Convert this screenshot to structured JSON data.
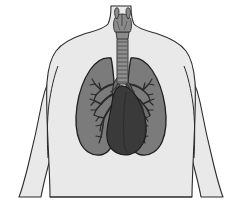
{
  "figure": {
    "caption": "Anterior view of human torso showing lungs, trachea, larynx, bronchial tree and heart",
    "width": 246,
    "height": 212,
    "background_color": "#ffffff",
    "view": "anterior",
    "style": "grayscale line illustration"
  },
  "palette": {
    "page_background": "#ffffff",
    "body_fill": "#e9e9e9",
    "body_outline": "#2b2b2b",
    "lung_fill": "#7b7b7b",
    "lung_outline": "#1f1f1f",
    "heart_fill": "#3a3a3a",
    "heart_outline": "#1a1a1a",
    "trachea_fill": "#8e8e8e",
    "trachea_outline": "#3a3a3a",
    "larynx_fill": "#8a8a8a",
    "larynx_outline": "#2f2f2f",
    "bronchi_stroke": "#2a2a2a",
    "vessel_fill": "#6e6e6e"
  },
  "parts": [
    {
      "id": "torso",
      "label": "Torso",
      "description": "Upper body silhouette with neck, shoulders and arms",
      "fill": "#e9e9e9",
      "stroke": "#2b2b2b"
    },
    {
      "id": "neck",
      "label": "Neck",
      "description": "Narrow neck column at top center",
      "fill": "#e9e9e9",
      "stroke": "#2b2b2b"
    },
    {
      "id": "left-arm",
      "label": "Left Arm",
      "description": "Viewer-left arm descending from shoulder",
      "fill": "#e9e9e9",
      "stroke": "#2b2b2b"
    },
    {
      "id": "right-arm",
      "label": "Right Arm",
      "description": "Viewer-right arm descending from shoulder",
      "fill": "#e9e9e9",
      "stroke": "#2b2b2b"
    },
    {
      "id": "larynx",
      "label": "Larynx",
      "description": "Thyroid cartilage and voice box at top of airway",
      "fill": "#8a8a8a",
      "stroke": "#2f2f2f"
    },
    {
      "id": "trachea",
      "label": "Trachea",
      "description": "Windpipe with horizontal cartilage rings",
      "fill": "#8e8e8e",
      "stroke": "#3a3a3a",
      "ring_count": 11
    },
    {
      "id": "right-lung",
      "label": "Right Lung",
      "description": "Viewer-left lung, three lobes",
      "fill": "#7b7b7b",
      "stroke": "#1f1f1f"
    },
    {
      "id": "left-lung",
      "label": "Left Lung",
      "description": "Viewer-right lung, two lobes with cardiac notch",
      "fill": "#7b7b7b",
      "stroke": "#1f1f1f"
    },
    {
      "id": "right-bronchial-tree",
      "label": "Right Bronchial Tree",
      "description": "Branching airways inside viewer-left lung",
      "stroke": "#2a2a2a"
    },
    {
      "id": "left-bronchial-tree",
      "label": "Left Bronchial Tree",
      "description": "Branching airways inside viewer-right lung",
      "stroke": "#2a2a2a"
    },
    {
      "id": "heart",
      "label": "Heart",
      "description": "Dark cardiac silhouette centered low between lungs",
      "fill": "#3a3a3a",
      "stroke": "#1a1a1a"
    },
    {
      "id": "great-vessels",
      "label": "Great Vessels",
      "description": "Aortic arch and pulmonary vessels above the heart",
      "fill": "#6e6e6e",
      "stroke": "#1a1a1a"
    }
  ]
}
